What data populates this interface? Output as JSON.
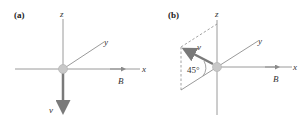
{
  "panels": [
    {
      "id": "a",
      "label": "(a)",
      "axes": {
        "x": "x",
        "y": "y",
        "z": "z"
      },
      "field_label": "B⃗",
      "velocity_label": "v⃗",
      "velocity_direction": "-z"
    },
    {
      "id": "b",
      "label": "(b)",
      "axes": {
        "x": "x",
        "y": "y",
        "z": "z"
      },
      "field_label": "B⃗",
      "velocity_label": "v⃗",
      "angle_label": "45°",
      "velocity_direction": "up-left in z / -y plane"
    }
  ],
  "colors": {
    "axis": "#9a9a9a",
    "vector": "#7a7a7a",
    "particle": "#c8c8c8",
    "dashed": "#8a8a8a",
    "text": "#333333"
  }
}
